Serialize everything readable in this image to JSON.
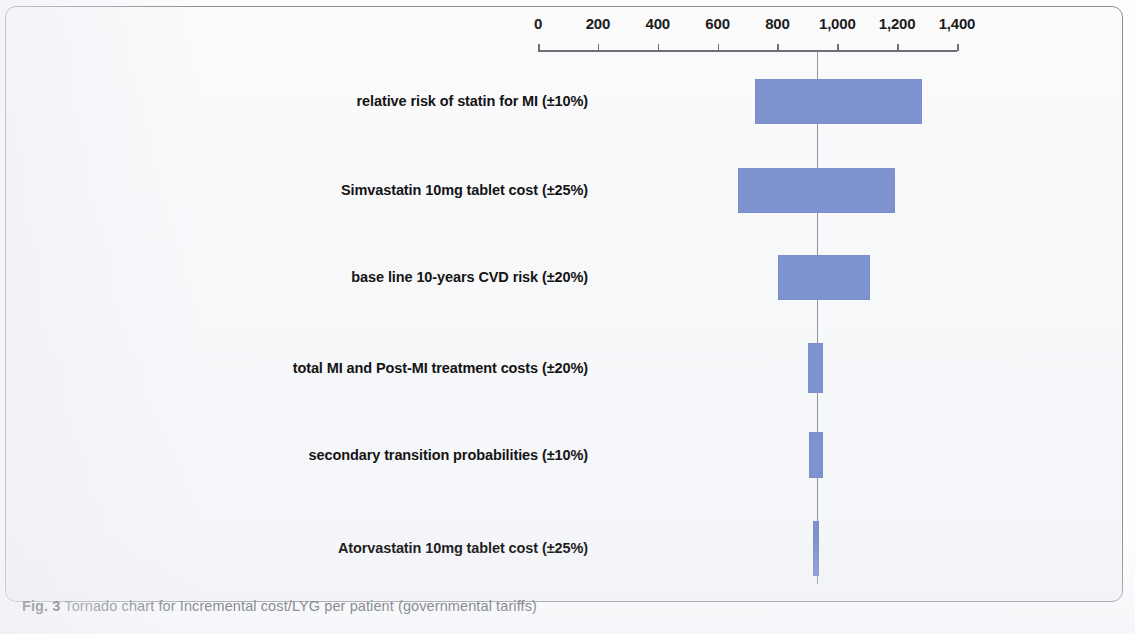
{
  "figure": {
    "caption_number": "Fig. 3",
    "caption_text": " Tornado chart for Incremental cost/LYG per patient (governmental tariffs)"
  },
  "chart_data": {
    "type": "bar",
    "subtype": "tornado",
    "title": "Tornado chart for Incremental cost/LYG per patient (governmental tariffs)",
    "xlabel": "",
    "ylabel": "",
    "xlim": [
      0,
      1400
    ],
    "grid": false,
    "legend": null,
    "orientation": "horizontal",
    "base_case": 932,
    "axis": {
      "tick_values": [
        0,
        200,
        400,
        600,
        800,
        1000,
        1200,
        1400
      ],
      "tick_labels": [
        "0",
        "200",
        "400",
        "600",
        "800",
        "1,000",
        "1,200",
        "1,400"
      ],
      "position": "top"
    },
    "categories": [
      "relative risk of statin for MI (±10%)",
      "Simvastatin 10mg tablet cost (±25%)",
      "base line 10-years  CVD risk (±20%)",
      "total MI and Post-MI treatment costs (±20%)",
      "secondary transition probabilities (±10%)",
      "Atorvastatin 10mg tablet cost (±25%)"
    ],
    "bars": [
      {
        "label": "relative risk of statin for MI (±10%)",
        "low": 725,
        "high": 1283
      },
      {
        "label": "Simvastatin 10mg tablet cost (±25%)",
        "low": 668,
        "high": 1193
      },
      {
        "label": "base line 10-years  CVD risk (±20%)",
        "low": 802,
        "high": 1110
      },
      {
        "label": "total MI and Post-MI treatment costs (±20%)",
        "low": 902,
        "high": 952
      },
      {
        "label": "secondary transition probabilities (±10%)",
        "low": 905,
        "high": 952
      },
      {
        "label": "Atorvastatin 10mg tablet cost (±25%)",
        "low": 919,
        "high": 939
      }
    ],
    "colors": {
      "bar": "#7d92cf",
      "axis": "#6d7078",
      "center_line": "#9295a0",
      "label_text": "#141414",
      "caption_text": "#4f5358"
    }
  }
}
